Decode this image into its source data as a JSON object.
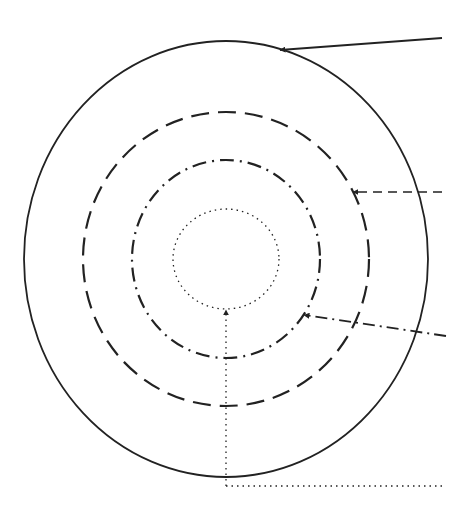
{
  "diagram": {
    "type": "concentric-circles",
    "stroke_color": "#222222",
    "background": "#ffffff",
    "center": [
      226,
      259
    ],
    "circles": [
      {
        "name": "outer-solid-circle",
        "style": "solid",
        "rx": 202,
        "ry": 218,
        "dash": ""
      },
      {
        "name": "dashed-circle",
        "style": "dashed",
        "rx": 143,
        "ry": 147,
        "dash": "18 9"
      },
      {
        "name": "dash-dot-circle",
        "style": "dash-dot",
        "rx": 94,
        "ry": 99,
        "dash": "14 6 2 6"
      },
      {
        "name": "dotted-circle",
        "style": "dotted",
        "rx": 53,
        "ry": 50,
        "dash": "1.5 4"
      }
    ],
    "arrows": [
      {
        "name": "solid-arrow",
        "style": "solid",
        "from": [
          442,
          38
        ],
        "to": [
          280,
          50
        ]
      },
      {
        "name": "dashed-arrow",
        "style": "dashed",
        "from": [
          442,
          192
        ],
        "to": [
          353,
          192
        ]
      },
      {
        "name": "dash-dot-arrow",
        "style": "dash-dot",
        "from": [
          446,
          336
        ],
        "to": [
          304,
          315
        ]
      },
      {
        "name": "dotted-arrow",
        "style": "dotted",
        "from": [
          226,
          486
        ],
        "to": [
          226,
          310
        ],
        "leader_to": [
          442,
          486
        ]
      }
    ]
  }
}
